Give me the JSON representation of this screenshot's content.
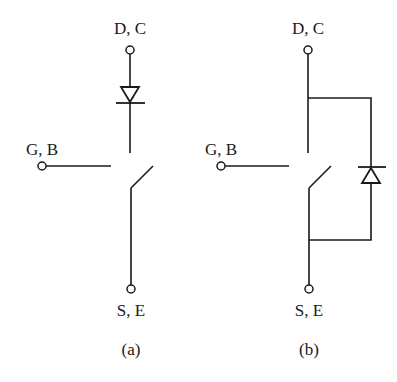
{
  "diagram": {
    "type": "switch-diode-equivalent-circuits",
    "colors": {
      "ink": "#1a1a1a",
      "background": "#ffffff"
    },
    "panels": [
      {
        "id": "a",
        "caption": "(a)",
        "terminals": {
          "top": "D, C",
          "left": "G, B",
          "bottom": "S, E"
        },
        "diode_placement": "series",
        "diode_direction": "down"
      },
      {
        "id": "b",
        "caption": "(b)",
        "terminals": {
          "top": "D, C",
          "left": "G, B",
          "bottom": "S, E"
        },
        "diode_placement": "antiparallel",
        "diode_direction": "up"
      }
    ]
  }
}
